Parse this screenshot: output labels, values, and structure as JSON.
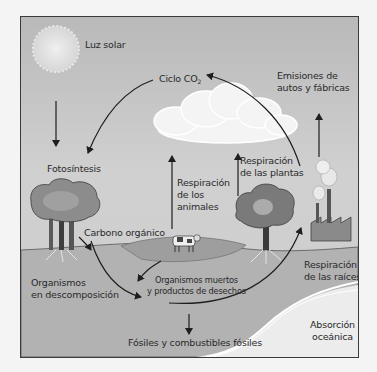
{
  "diagram": {
    "type": "carbon-cycle",
    "labels": {
      "sunlight": "Luz solar",
      "co2_cycle_prefix": "Ciclo CO",
      "co2_cycle_sub": "2",
      "emissions_line1": "Emisiones de",
      "emissions_line2": "autos y fábricas",
      "photosynthesis": "Fotosíntesis",
      "plant_respiration_line1": "Respiración",
      "plant_respiration_line2": "de las plantas",
      "animal_respiration_line1": "Respiración",
      "animal_respiration_line2": "de los",
      "animal_respiration_line3": "animales",
      "organic_carbon": "Carbono orgánico",
      "decomposers_line1": "Organismos",
      "decomposers_line2": "en descomposición",
      "dead_organisms_line1": "Organismos muertos",
      "dead_organisms_line2": "y productos de desechos",
      "root_respiration_line1": "Respiración",
      "root_respiration_line2": "de las raíces",
      "ocean_absorption_line1": "Absorción",
      "ocean_absorption_line2": "oceánica",
      "fossils": "Fósiles y combustibles fósiles"
    },
    "colors": {
      "sky_top": "#b9b9b9",
      "sky_bottom": "#d0d0d0",
      "ground": "#b4b4b4",
      "hill": "#a4a4a4",
      "ocean": "#ececec",
      "arrow": "#1e1e1e",
      "text": "#2a2a2a"
    }
  }
}
